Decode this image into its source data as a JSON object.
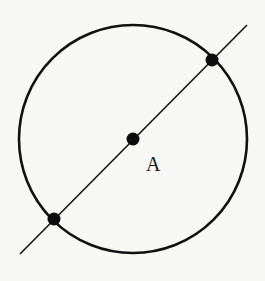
{
  "diagram": {
    "colors": {
      "background": "#f7f7f5",
      "stroke": "#111111",
      "point": "#0d0d0d",
      "label": "#1a1a1a"
    },
    "circle": {
      "center_label": "A",
      "description": "circle centered at point A"
    },
    "line": {
      "description": "straight line through center A intersecting the circle at two points (diameter)",
      "slope_direction": "lower-left to upper-right"
    },
    "points": [
      {
        "id": "center",
        "label": "A",
        "role": "center of circle"
      },
      {
        "id": "upper-right-intersection",
        "label": "",
        "role": "intersection of line and circle"
      },
      {
        "id": "lower-left-intersection",
        "label": "",
        "role": "intersection of line and circle"
      }
    ],
    "labels": [
      {
        "text": "A",
        "refers_to": "center"
      }
    ]
  }
}
